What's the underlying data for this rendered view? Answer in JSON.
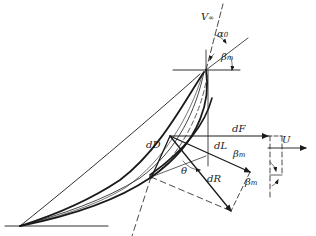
{
  "diagram": {
    "type": "blade-element force diagram",
    "labels": {
      "v_inf": "V",
      "v_inf_sub": "∞",
      "alpha0": "α",
      "alpha0_sub": "0",
      "beta_m_top": "β",
      "beta_m_top_sub": "m",
      "dF": "dF",
      "dL": "dL",
      "dD": "dD",
      "dR": "dR",
      "theta": "θ",
      "beta_m_mid": "β",
      "beta_m_mid_sub": "m",
      "beta_m_low": "β",
      "beta_m_low_sub": "m",
      "U": "U"
    },
    "colors": {
      "ink": "#1a1a1a",
      "background": "#ffffff"
    }
  }
}
